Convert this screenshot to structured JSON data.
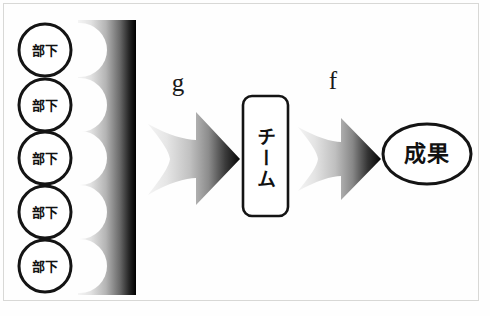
{
  "diagram": {
    "canvas": {
      "width": 490,
      "height": 316,
      "background": "#fefefe"
    },
    "border_color": "#d8d8d6",
    "ink_color": "#111111",
    "gradient": {
      "from": "#f2f2f2",
      "to": "#000000"
    },
    "nodes": {
      "subordinates": [
        {
          "label": "部下",
          "cx": 45,
          "cy": 50
        },
        {
          "label": "部下",
          "cx": 45,
          "cy": 105
        },
        {
          "label": "部下",
          "cx": 45,
          "cy": 158
        },
        {
          "label": "部下",
          "cx": 45,
          "cy": 212
        },
        {
          "label": "部下",
          "cx": 45,
          "cy": 266
        }
      ],
      "team": {
        "label": "チーム",
        "shape": "rounded-rectangle"
      },
      "outcome": {
        "label": "成果",
        "shape": "ellipse"
      }
    },
    "functions": [
      {
        "name": "g",
        "from": "subordinates",
        "to": "team"
      },
      {
        "name": "f",
        "from": "team",
        "to": "outcome"
      }
    ],
    "icons": {
      "aggregator": "merge-bar-icon",
      "arrow_g": "gradient-arrow-right-icon",
      "arrow_f": "gradient-arrow-right-icon"
    }
  }
}
